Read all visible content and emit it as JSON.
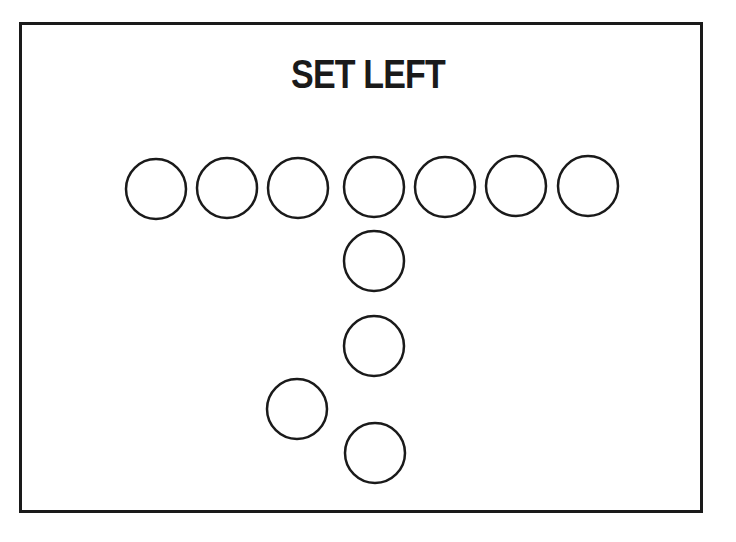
{
  "title": "SET LEFT",
  "colors": {
    "stroke": "#1a1a1a",
    "background": "#ffffff"
  },
  "formation": {
    "name": "Set Left",
    "circle_radius": 30,
    "players": [
      {
        "id": "line-1",
        "cx": 156,
        "cy": 189
      },
      {
        "id": "line-2",
        "cx": 227,
        "cy": 188
      },
      {
        "id": "line-3",
        "cx": 298,
        "cy": 188
      },
      {
        "id": "line-4-center",
        "cx": 374,
        "cy": 187
      },
      {
        "id": "line-5",
        "cx": 445,
        "cy": 187
      },
      {
        "id": "line-6",
        "cx": 516,
        "cy": 186
      },
      {
        "id": "line-7",
        "cx": 588,
        "cy": 186
      },
      {
        "id": "quarterback",
        "cx": 374,
        "cy": 261
      },
      {
        "id": "fullback",
        "cx": 374,
        "cy": 346
      },
      {
        "id": "left-halfback",
        "cx": 297,
        "cy": 409
      },
      {
        "id": "tailback",
        "cx": 375,
        "cy": 453
      }
    ]
  }
}
